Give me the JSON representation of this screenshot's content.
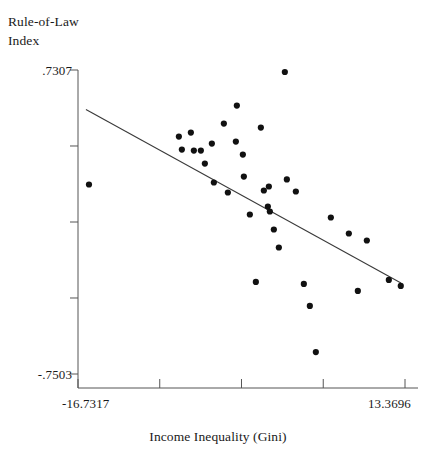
{
  "chart_data": {
    "type": "scatter",
    "title": "",
    "xlabel": "Income Inequality (Gini)",
    "ylabel": "Rule-of-Law\nIndex",
    "ylabel_line1": "Rule-of-Law",
    "ylabel_line2": "Index",
    "xlim": [
      -16.7317,
      13.3696
    ],
    "ylim": [
      -0.7503,
      0.7307
    ],
    "xticks": [
      -16.7317,
      -9.2064,
      -1.6811,
      5.8442,
      13.3696
    ],
    "xtick_labels": [
      "-16.7317",
      "",
      "",
      "",
      "13.3696"
    ],
    "xtick_label_min": "-16.7317",
    "xtick_label_max": "13.3696",
    "yticks": [
      -0.7503,
      -0.38,
      -0.0098,
      0.3605,
      0.7307
    ],
    "ytick_labels": [
      "-.7503",
      "",
      "",
      "",
      ".7307"
    ],
    "ytick_label_min": "-.7503",
    "ytick_label_max": ".7307",
    "grid": false,
    "legend": false,
    "marker_color": "#111111",
    "line_color": "#3a3a3a",
    "axis_color": "#555555",
    "points": [
      {
        "x": -15.721,
        "y": 0.173
      },
      {
        "x": -7.446,
        "y": 0.4065
      },
      {
        "x": -7.1699,
        "y": 0.3432
      },
      {
        "x": -6.3416,
        "y": 0.426
      },
      {
        "x": -6.0656,
        "y": 0.3383
      },
      {
        "x": -5.4214,
        "y": 0.3383
      },
      {
        "x": -5.0533,
        "y": 0.2749
      },
      {
        "x": -4.4091,
        "y": 0.3724
      },
      {
        "x": -4.2251,
        "y": 0.1827
      },
      {
        "x": -3.3047,
        "y": 0.4698
      },
      {
        "x": -2.9366,
        "y": 0.134
      },
      {
        "x": -2.2004,
        "y": 0.3821
      },
      {
        "x": -2.1084,
        "y": 0.5575
      },
      {
        "x": -1.5562,
        "y": 0.3188
      },
      {
        "x": -1.4642,
        "y": 0.2116
      },
      {
        "x": -0.912,
        "y": 0.0268
      },
      {
        "x": -0.3598,
        "y": -0.3019
      },
      {
        "x": 0.1004,
        "y": 0.4503
      },
      {
        "x": 0.3765,
        "y": 0.1437
      },
      {
        "x": 0.7446,
        "y": 0.0658
      },
      {
        "x": 0.8366,
        "y": 0.1632
      },
      {
        "x": 0.9286,
        "y": 0.0414
      },
      {
        "x": 1.2967,
        "y": -0.0463
      },
      {
        "x": 1.7569,
        "y": -0.1341
      },
      {
        "x": 2.309,
        "y": 0.721
      },
      {
        "x": 2.4931,
        "y": 0.1974
      },
      {
        "x": 3.3214,
        "y": 0.1389
      },
      {
        "x": 4.0576,
        "y": -0.3117
      },
      {
        "x": 4.6098,
        "y": -0.4185
      },
      {
        "x": 5.162,
        "y": -0.6434
      },
      {
        "x": 6.5424,
        "y": 0.0122
      },
      {
        "x": 8.1989,
        "y": -0.0658
      },
      {
        "x": 9.0273,
        "y": -0.3458
      },
      {
        "x": 9.8556,
        "y": -0.1
      },
      {
        "x": 11.8805,
        "y": -0.2922
      },
      {
        "x": 12.98,
        "y": -0.3214
      }
    ],
    "fit_line": {
      "name": "linear fit",
      "x_start": -16.0,
      "y_start": 0.538,
      "x_end": 13.0,
      "y_end": -0.3068
    }
  }
}
